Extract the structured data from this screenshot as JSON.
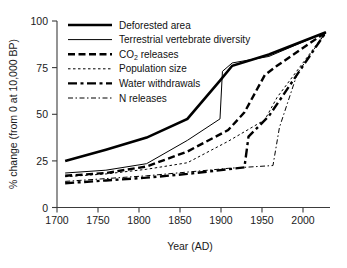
{
  "chart_data": {
    "type": "line",
    "title": "",
    "xlabel": "Year (AD)",
    "ylabel": "% change (from 0 at 10,000 BP)",
    "xlim": [
      1690,
      2025
    ],
    "ylim": [
      0,
      100
    ],
    "xticks": [
      1700,
      1750,
      1800,
      1850,
      1900,
      1950,
      2000
    ],
    "xtick_labels": [
      "1700",
      "1750",
      "1800",
      "1850",
      "1900",
      "1950",
      "2000"
    ],
    "yticks": [
      0,
      25,
      50,
      75,
      100
    ],
    "ytick_labels": [
      "0",
      "25",
      "50",
      "75",
      "100"
    ],
    "grid": false,
    "legend_position": "upper-left-inside",
    "series": [
      {
        "name": "Deforested area",
        "style": "solid",
        "width": 2.6,
        "x": [
          1700,
          1750,
          1800,
          1850,
          1890,
          1905,
          1950,
          2020
        ],
        "y": [
          25,
          31,
          37.5,
          47.5,
          68,
          76,
          82,
          94
        ]
      },
      {
        "name": "Terrestrial vertebrate diversity",
        "style": "solid",
        "width": 1.0,
        "x": [
          1700,
          1750,
          1800,
          1850,
          1890,
          1893,
          1905,
          1950,
          2020
        ],
        "y": [
          18.5,
          20,
          23.5,
          36,
          47.5,
          73,
          77.5,
          81,
          94
        ]
      },
      {
        "name": "CO2 releases",
        "style": "dashed",
        "width": 2.4,
        "x": [
          1700,
          1750,
          1800,
          1850,
          1900,
          1920,
          1945,
          1960,
          2020
        ],
        "y": [
          17,
          18.5,
          22,
          30,
          41.5,
          51,
          71,
          76,
          94
        ]
      },
      {
        "name": "Population size",
        "style": "dotted",
        "width": 1.0,
        "x": [
          1700,
          1750,
          1800,
          1850,
          1900,
          1945,
          1960,
          2020
        ],
        "y": [
          16.5,
          18,
          20.5,
          24,
          35.5,
          47,
          59,
          94
        ]
      },
      {
        "name": "Water withdrawals",
        "style": "dashdot",
        "width": 2.4,
        "x": [
          1700,
          1750,
          1800,
          1850,
          1900,
          1920,
          1925,
          1950,
          2020
        ],
        "y": [
          13,
          14.5,
          16,
          18,
          20.5,
          21.5,
          38,
          49,
          94
        ]
      },
      {
        "name": "N releases",
        "style": "dashdotdot",
        "width": 1.0,
        "x": [
          1700,
          1750,
          1800,
          1850,
          1900,
          1955,
          1963,
          1985,
          2020
        ],
        "y": [
          14,
          15.5,
          17,
          19,
          21,
          22.5,
          43,
          72,
          94
        ]
      }
    ],
    "legend": [
      {
        "label": "Deforested area",
        "style": "solid",
        "width": 2.6,
        "subscript": ""
      },
      {
        "label": "Terrestrial vertebrate diversity",
        "style": "solid",
        "width": 1.0,
        "subscript": ""
      },
      {
        "label_prefix": "CO",
        "subscript": "2",
        "label_suffix": " releases",
        "label": "CO2 releases",
        "style": "dashed",
        "width": 2.4
      },
      {
        "label": "Population size",
        "style": "dotted",
        "width": 1.0,
        "subscript": ""
      },
      {
        "label": "Water withdrawals",
        "style": "dashdot",
        "width": 2.4,
        "subscript": ""
      },
      {
        "label": "N releases",
        "style": "dashdotdot",
        "width": 1.0,
        "subscript": ""
      }
    ]
  },
  "colors": {
    "ink": "#000000",
    "axis": "#3b3b3b",
    "background": "#ffffff"
  }
}
